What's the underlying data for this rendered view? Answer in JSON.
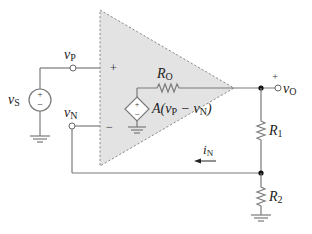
{
  "diagram": {
    "type": "op-amp non-inverting amplifier circuit model",
    "labels": {
      "source": {
        "main": "v",
        "sub": "S"
      },
      "vp": {
        "main": "v",
        "sub": "P"
      },
      "vn": {
        "main": "v",
        "sub": "N"
      },
      "ro": {
        "main": "R",
        "sub": "O"
      },
      "dep_source": {
        "pre": "A(v",
        "sub1": "P",
        "mid": " − v",
        "sub2": "N",
        "post": ")"
      },
      "vo": {
        "main": "v",
        "sub": "O"
      },
      "r1": {
        "main": "R",
        "sub": "1"
      },
      "r2": {
        "main": "R",
        "sub": "2"
      },
      "in": {
        "main": "i",
        "sub": "N"
      }
    },
    "signs": {
      "plus": "+",
      "minus": "−"
    },
    "colors": {
      "opamp_fill": "#e3e3e3",
      "wire": "#7a7a7a",
      "text": "#222222"
    }
  }
}
